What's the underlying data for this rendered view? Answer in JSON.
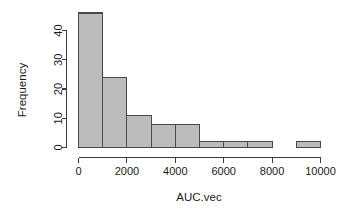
{
  "chart_data": {
    "type": "bar",
    "title": "",
    "subtitle": "",
    "xlabel": "AUC.vec",
    "ylabel": "Frequency",
    "grid": false,
    "legend": null,
    "bin_width": 1000,
    "bin_edges": [
      0,
      1000,
      2000,
      3000,
      4000,
      5000,
      6000,
      7000,
      8000,
      9000,
      10000
    ],
    "categories": [
      "0-1000",
      "1000-2000",
      "2000-3000",
      "3000-4000",
      "4000-5000",
      "5000-6000",
      "6000-7000",
      "7000-8000",
      "8000-9000",
      "9000-10000"
    ],
    "values": [
      46,
      24,
      11,
      8,
      8,
      2,
      2,
      2,
      0,
      2
    ],
    "xlim": [
      0,
      10000
    ],
    "ylim": [
      0,
      46
    ],
    "xticks": [
      0,
      2000,
      4000,
      6000,
      8000,
      10000
    ],
    "xtick_labels": [
      "0",
      "2000",
      "4000",
      "6000",
      "8000",
      "10000"
    ],
    "yticks": [
      0,
      10,
      20,
      30,
      40
    ],
    "ytick_labels": [
      "0",
      "10",
      "20",
      "30",
      "40"
    ],
    "bar_fill": "#bcbcbc",
    "bar_border": "#4a4a4a",
    "axis_color": "#3b3b3b",
    "background": "#ffffff"
  },
  "axes": {
    "y_title": "Frequency",
    "x_title": "AUC.vec"
  },
  "y_ticks": [
    {
      "label": "0",
      "value": 0
    },
    {
      "label": "10",
      "value": 10
    },
    {
      "label": "20",
      "value": 20
    },
    {
      "label": "30",
      "value": 30
    },
    {
      "label": "40",
      "value": 40
    }
  ],
  "x_ticks": [
    {
      "label": "0",
      "value": 0
    },
    {
      "label": "2000",
      "value": 2000
    },
    {
      "label": "4000",
      "value": 4000
    },
    {
      "label": "6000",
      "value": 6000
    },
    {
      "label": "8000",
      "value": 8000
    },
    {
      "label": "10000",
      "value": 10000
    }
  ]
}
